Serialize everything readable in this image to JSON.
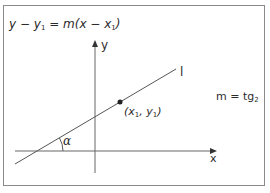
{
  "diagram": {
    "title_equation": {
      "lhs_var": "y",
      "minus1": " − ",
      "y1": "y",
      "sub1": "1",
      "eq": " = m(x − x",
      "sub2": "1",
      "close": ")"
    },
    "axes": {
      "x_label": "x",
      "y_label": "y"
    },
    "line_label": "l",
    "point": {
      "open": "(x",
      "sub_x": "1",
      "sep": ", y",
      "sub_y": "1",
      "close": ")"
    },
    "angle_label": "α",
    "slope_formula": {
      "text": "m = tg",
      "sub": "2"
    },
    "colors": {
      "frame": "#8a8a8a",
      "axes": "#555555",
      "line": "#555555",
      "point": "#222222",
      "text": "#2b2b2b"
    }
  }
}
